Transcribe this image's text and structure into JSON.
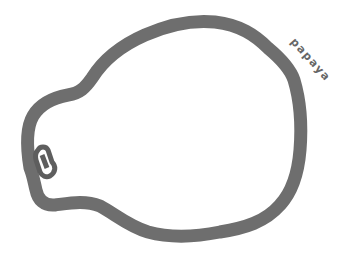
{
  "drawing": {
    "subject": "papaya-outline",
    "label": "papaya",
    "stroke_color": "#6e6e6e",
    "label_color": "#666666",
    "background": "#ffffff"
  }
}
